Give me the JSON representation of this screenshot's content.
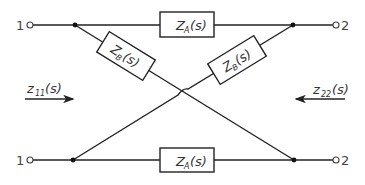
{
  "diagram": {
    "type": "lattice two-port network",
    "terminals": {
      "top_left": "1",
      "bottom_left": "1",
      "top_right": "2",
      "bottom_right": "2"
    },
    "impedances": {
      "top_series": {
        "main": "Z",
        "sub": "A",
        "arg": "(s)"
      },
      "bottom_series": {
        "main": "Z",
        "sub": "A",
        "arg": "(s)"
      },
      "left_diagonal": {
        "main": "Z",
        "sub": "B",
        "arg": "(s)"
      },
      "right_diagonal": {
        "main": "Z",
        "sub": "B",
        "arg": "(s)"
      }
    },
    "port_impedances": {
      "input": {
        "main": "z",
        "sub": "11",
        "arg": "(s)",
        "arrow": "right"
      },
      "output": {
        "main": "z",
        "sub": "22",
        "arg": "(s)",
        "arrow": "left"
      }
    }
  }
}
